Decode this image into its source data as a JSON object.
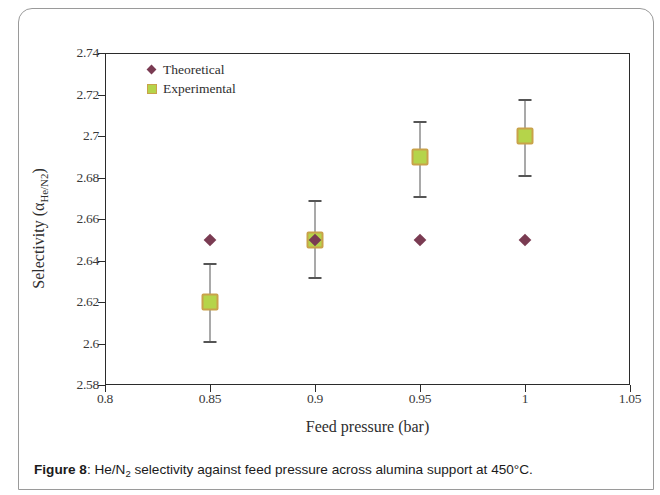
{
  "caption": {
    "figure_number": "Figure 8",
    "separator": ": ",
    "text_before_sub": "He/N",
    "subscript": "2",
    "text_after_sub": " selectivity against feed pressure across alumina support at 450°C."
  },
  "axes": {
    "x_title": "Feed pressure (bar)",
    "y_title_main": "Selectivity (α",
    "y_title_sub": "He/N2",
    "y_title_close": ")"
  },
  "legend": {
    "items": [
      {
        "label": "Theoretical",
        "marker": "diamond-marker-icon",
        "color": "#7a3b52"
      },
      {
        "label": "Experimental",
        "marker": "square-marker-icon",
        "color": "#b5d44a"
      }
    ]
  },
  "chart_data": {
    "type": "scatter",
    "title": "",
    "xlabel": "Feed pressure (bar)",
    "ylabel": "Selectivity (αHe/N2)",
    "xlim": [
      0.8,
      1.05
    ],
    "ylim": [
      2.58,
      2.74
    ],
    "xticks": [
      "0.8",
      "0.85",
      "0.9",
      "0.95",
      "1",
      "1.05"
    ],
    "xtick_values": [
      0.8,
      0.85,
      0.9,
      0.95,
      1.0,
      1.05
    ],
    "yticks": [
      "2.58",
      "2.6",
      "2.62",
      "2.64",
      "2.66",
      "2.68",
      "2.7",
      "2.72",
      "2.74"
    ],
    "ytick_values": [
      2.58,
      2.6,
      2.62,
      2.64,
      2.66,
      2.68,
      2.7,
      2.72,
      2.74
    ],
    "grid": false,
    "legend_position": "top-left",
    "x": [
      0.85,
      0.9,
      0.95,
      1.0
    ],
    "series": [
      {
        "name": "Theoretical",
        "marker": "diamond",
        "color": "#7a3b52",
        "values": [
          2.65,
          2.65,
          2.65,
          2.65
        ]
      },
      {
        "name": "Experimental",
        "marker": "square",
        "color": "#b5d44a",
        "values": [
          2.62,
          2.65,
          2.69,
          2.7
        ],
        "error_low": [
          2.601,
          2.632,
          2.671,
          2.681
        ],
        "error_high": [
          2.639,
          2.669,
          2.707,
          2.718
        ]
      }
    ]
  }
}
